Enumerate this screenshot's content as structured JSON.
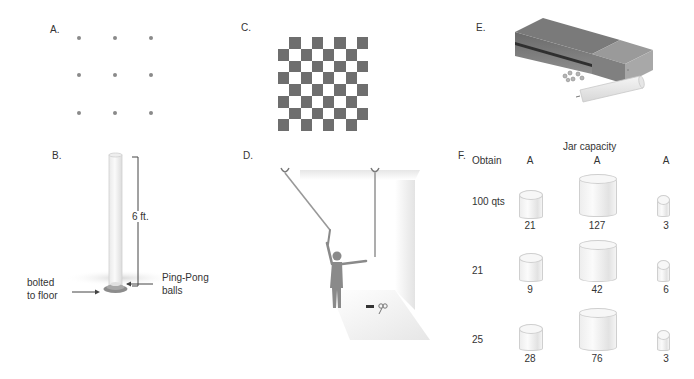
{
  "panels": {
    "a": {
      "label": "A.",
      "description": "nine-dot problem",
      "dots": [
        [
          79,
          38
        ],
        [
          115,
          38
        ],
        [
          151,
          38
        ],
        [
          79,
          75
        ],
        [
          115,
          75
        ],
        [
          151,
          75
        ],
        [
          79,
          113
        ],
        [
          115,
          113
        ],
        [
          151,
          113
        ]
      ]
    },
    "b": {
      "label": "B.",
      "description": "ping-pong ball tube problem",
      "height_label": "6 ft.",
      "left_callout": [
        "bolted",
        "to floor"
      ],
      "right_callout": [
        "Ping-Pong",
        "balls"
      ]
    },
    "c": {
      "label": "C.",
      "description": "mutilated checkerboard",
      "rows": 8,
      "cols": 8,
      "removed_squares": [
        [
          0,
          0
        ],
        [
          7,
          7
        ]
      ],
      "dark_color": "#6e6e6e",
      "light_color": "#ffffff"
    },
    "d": {
      "label": "D.",
      "description": "two-string problem"
    },
    "e": {
      "label": "E.",
      "description": "candle problem: matchbox, tacks, candle"
    },
    "f": {
      "label": "F.",
      "description": "water jar problem",
      "title": "Jar capacity",
      "obtain_header": "Obtain",
      "jar_headers": [
        "A",
        "A",
        "A"
      ],
      "rows": [
        {
          "obtain": "100 qts",
          "values": [
            "21",
            "127",
            "3"
          ]
        },
        {
          "obtain": "21",
          "values": [
            "9",
            "42",
            "6"
          ]
        },
        {
          "obtain": "25",
          "values": [
            "28",
            "76",
            "3"
          ]
        }
      ]
    }
  }
}
